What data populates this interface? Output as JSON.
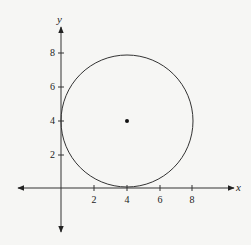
{
  "diagram": {
    "type": "coordinate-plane-circle",
    "axes": {
      "x_label": "x",
      "y_label": "y",
      "x_ticks": [
        "2",
        "4",
        "6",
        "8"
      ],
      "y_ticks": [
        "2",
        "4",
        "6",
        "8"
      ]
    },
    "circle": {
      "center": [
        4,
        4
      ],
      "radius": 4
    },
    "colors": {
      "stroke": "#333333",
      "background": "#f6f6f4"
    }
  }
}
